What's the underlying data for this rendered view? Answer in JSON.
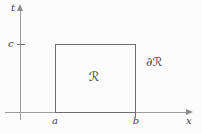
{
  "figure": {
    "axis_labels": {
      "vertical": "t",
      "horizontal": "x"
    },
    "tick_labels": {
      "t_axis": "c",
      "x_axis_left": "a",
      "x_axis_right": "b"
    },
    "region_label": "ℛ",
    "boundary_label": "∂ℛ",
    "colors": {
      "background": "#fcfcfc",
      "axis": "#9b9b9b",
      "rectangle_border": "#6f6f6f",
      "text": "#3f3f3f"
    }
  }
}
